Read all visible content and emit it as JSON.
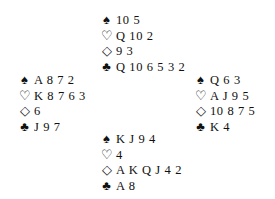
{
  "diagram": {
    "type": "bridge-deal",
    "hands": {
      "north": {
        "spades": "10 5",
        "hearts": "Q 10 2",
        "diamonds": "9 3",
        "clubs": "Q 10 6 5 3 2"
      },
      "west": {
        "spades": "A 8 7 2",
        "hearts": "K 8 7 6 3",
        "diamonds": "6",
        "clubs": "J 9 7"
      },
      "east": {
        "spades": "Q 6 3",
        "hearts": "A J 9 5",
        "diamonds": "10 8 7 5",
        "clubs": "K 4"
      },
      "south": {
        "spades": "K J 9 4",
        "hearts": "4",
        "diamonds": "A K Q J 4 2",
        "clubs": "A 8"
      }
    },
    "suit_symbols": {
      "spades": "♠",
      "hearts": "♡",
      "diamonds": "◇",
      "clubs": "♣"
    }
  }
}
